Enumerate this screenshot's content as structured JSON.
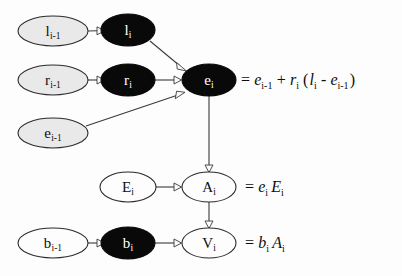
{
  "figure": {
    "type": "directed-graph-diagram",
    "background_color": "#fdfdfd",
    "width": 402,
    "height": 276
  },
  "legend_styles": {
    "observed_node_fill": "#090909",
    "observed_node_text": "#ffffff",
    "prior_node_fill": "#e9e9e9",
    "latent_node_fill": "#fdfdfd",
    "edge_color": "#3a3a3a",
    "arrowhead_style": "open-triangle"
  },
  "nodes": [
    {
      "id": "l_prev",
      "base": "l",
      "sub": "i-1",
      "fill": "gray",
      "cx": 53,
      "cy": 31,
      "rx": 35,
      "ry": 15
    },
    {
      "id": "l_cur",
      "base": "l",
      "sub": "i",
      "fill": "black",
      "cx": 128,
      "cy": 30,
      "rx": 27,
      "ry": 16
    },
    {
      "id": "r_prev",
      "base": "r",
      "sub": "i-1",
      "fill": "gray",
      "cx": 53,
      "cy": 80,
      "rx": 35,
      "ry": 15
    },
    {
      "id": "r_cur",
      "base": "r",
      "sub": "i",
      "fill": "black",
      "cx": 128,
      "cy": 80,
      "rx": 27,
      "ry": 16
    },
    {
      "id": "e_cur",
      "base": "e",
      "sub": "i",
      "fill": "black",
      "cx": 209,
      "cy": 80,
      "rx": 27,
      "ry": 16
    },
    {
      "id": "e_prev",
      "base": "e",
      "sub": "i-1",
      "fill": "gray",
      "cx": 53,
      "cy": 133,
      "rx": 35,
      "ry": 15
    },
    {
      "id": "E_cur",
      "base": "E",
      "sub": "i",
      "fill": "white",
      "cx": 128,
      "cy": 187,
      "rx": 28,
      "ry": 15
    },
    {
      "id": "A_cur",
      "base": "A",
      "sub": "i",
      "fill": "white",
      "cx": 209,
      "cy": 187,
      "rx": 27,
      "ry": 15
    },
    {
      "id": "b_prev",
      "base": "b",
      "sub": "i-1",
      "fill": "white",
      "cx": 53,
      "cy": 243,
      "rx": 35,
      "ry": 15
    },
    {
      "id": "b_cur",
      "base": "b",
      "sub": "i",
      "fill": "black",
      "cx": 128,
      "cy": 243,
      "rx": 27,
      "ry": 16
    },
    {
      "id": "V_cur",
      "base": "V",
      "sub": "i",
      "fill": "white",
      "cx": 209,
      "cy": 243,
      "rx": 27,
      "ry": 15
    }
  ],
  "edges": [
    {
      "id": "e1",
      "from": "l_prev",
      "to": "l_cur",
      "kind": "horizontal"
    },
    {
      "id": "e2",
      "from": "r_prev",
      "to": "r_cur",
      "kind": "horizontal"
    },
    {
      "id": "e3",
      "from": "l_cur",
      "to": "e_cur",
      "kind": "diagonal-down"
    },
    {
      "id": "e4",
      "from": "r_cur",
      "to": "e_cur",
      "kind": "horizontal"
    },
    {
      "id": "e5",
      "from": "e_prev",
      "to": "e_cur",
      "kind": "diagonal-up"
    },
    {
      "id": "e6",
      "from": "e_cur",
      "to": "A_cur",
      "kind": "vertical"
    },
    {
      "id": "e7",
      "from": "E_cur",
      "to": "A_cur",
      "kind": "horizontal"
    },
    {
      "id": "e8",
      "from": "A_cur",
      "to": "V_cur",
      "kind": "vertical"
    },
    {
      "id": "e9",
      "from": "b_prev",
      "to": "b_cur",
      "kind": "horizontal"
    },
    {
      "id": "e10",
      "from": "b_cur",
      "to": "V_cur",
      "kind": "horizontal"
    }
  ],
  "labels": {
    "l_prev": {
      "base": "l",
      "sub": "i-1"
    },
    "l_cur": {
      "base": "l",
      "sub": "i"
    },
    "r_prev": {
      "base": "r",
      "sub": "i-1"
    },
    "r_cur": {
      "base": "r",
      "sub": "i"
    },
    "e_cur": {
      "base": "e",
      "sub": "i"
    },
    "e_prev": {
      "base": "e",
      "sub": "i-1"
    },
    "E_cur": {
      "base": "E",
      "sub": "i"
    },
    "A_cur": {
      "base": "A",
      "sub": "i"
    },
    "b_prev": {
      "base": "b",
      "sub": "i-1"
    },
    "b_cur": {
      "base": "b",
      "sub": "i"
    },
    "V_cur": {
      "base": "V",
      "sub": "i"
    }
  },
  "equations": {
    "e_cur": {
      "for_node": "e_cur",
      "x": 240,
      "y": 80,
      "plain": "= e_i-1 + r_i ( l_i - e_i-1 )",
      "tokens": [
        {
          "t": "=",
          "style": "op"
        },
        {
          "t": "e",
          "sub": "i-1"
        },
        {
          "t": "+",
          "style": "op"
        },
        {
          "t": "r",
          "sub": "i"
        },
        {
          "t": "(",
          "style": "op"
        },
        {
          "t": "l",
          "sub": "i"
        },
        {
          "t": "-",
          "style": "op"
        },
        {
          "t": "e",
          "sub": "i-1"
        },
        {
          "t": ")",
          "style": "op"
        }
      ]
    },
    "A_cur": {
      "for_node": "A_cur",
      "x": 244,
      "y": 187,
      "plain": "= e_i E_i",
      "tokens": [
        {
          "t": "=",
          "style": "op"
        },
        {
          "t": "e",
          "sub": "i"
        },
        {
          "t": "E",
          "sub": "i"
        }
      ]
    },
    "V_cur": {
      "for_node": "V_cur",
      "x": 244,
      "y": 243,
      "plain": "= b_i A_i",
      "tokens": [
        {
          "t": "=",
          "style": "op"
        },
        {
          "t": "b",
          "sub": "i"
        },
        {
          "t": "A",
          "sub": "i"
        }
      ]
    }
  }
}
